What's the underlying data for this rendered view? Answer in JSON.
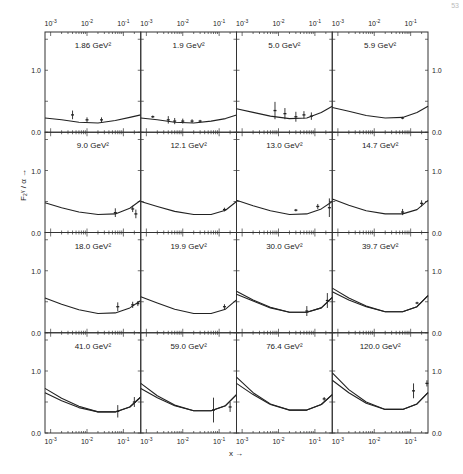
{
  "figure": {
    "page_number": "53",
    "ylabel": "F₂ᵞ / α →",
    "xlabel": "x →"
  },
  "chart_data": {
    "type": "line",
    "title": "",
    "xlabel": "x →",
    "ylabel": "F2^γ / α →",
    "xscale": "log",
    "xlim": [
      0.0007,
      0.3
    ],
    "ylim": [
      0.0,
      1.6
    ],
    "grid": false,
    "layout": "4x4 small multiples",
    "x_tick_labels": [
      "10^-3",
      "10^-2",
      "10^-1"
    ],
    "y_tick_labels": [
      "0.0",
      "1.0"
    ],
    "panels": [
      {
        "label": "1.86 GeV²",
        "q2": 1.86,
        "curves": [
          {
            "x": [
              0.0007,
              0.002,
              0.006,
              0.02,
              0.06,
              0.15,
              0.3
            ],
            "y": [
              0.23,
              0.2,
              0.16,
              0.15,
              0.19,
              0.24,
              0.28
            ]
          }
        ],
        "points": [
          {
            "x": 0.004,
            "y": 0.28,
            "err": 0.07
          },
          {
            "x": 0.01,
            "y": 0.2,
            "err": 0.04
          },
          {
            "x": 0.025,
            "y": 0.2,
            "err": 0.04
          }
        ]
      },
      {
        "label": "1.9 GeV²",
        "q2": 1.9,
        "curves": [
          {
            "x": [
              0.0007,
              0.002,
              0.006,
              0.02,
              0.06,
              0.15,
              0.3
            ],
            "y": [
              0.23,
              0.2,
              0.16,
              0.15,
              0.18,
              0.22,
              0.28
            ]
          }
        ],
        "points": [
          {
            "x": 0.0015,
            "y": 0.25,
            "err": 0.02
          },
          {
            "x": 0.004,
            "y": 0.2,
            "err": 0.06
          },
          {
            "x": 0.006,
            "y": 0.18,
            "err": 0.05
          },
          {
            "x": 0.01,
            "y": 0.18,
            "err": 0.04
          },
          {
            "x": 0.018,
            "y": 0.18,
            "err": 0.03
          },
          {
            "x": 0.03,
            "y": 0.18,
            "err": 0.02
          }
        ]
      },
      {
        "label": "5.0 GeV²",
        "q2": 5.0,
        "curves": [
          {
            "x": [
              0.0007,
              0.002,
              0.006,
              0.02,
              0.06,
              0.15,
              0.3
            ],
            "y": [
              0.38,
              0.32,
              0.26,
              0.22,
              0.23,
              0.32,
              0.42
            ]
          }
        ],
        "points": [
          {
            "x": 0.008,
            "y": 0.35,
            "err": 0.14
          },
          {
            "x": 0.015,
            "y": 0.3,
            "err": 0.09
          },
          {
            "x": 0.03,
            "y": 0.25,
            "err": 0.08
          },
          {
            "x": 0.05,
            "y": 0.28,
            "err": 0.06
          },
          {
            "x": 0.08,
            "y": 0.26,
            "err": 0.06
          }
        ]
      },
      {
        "label": "5.9 GeV²",
        "q2": 5.9,
        "curves": [
          {
            "x": [
              0.0007,
              0.002,
              0.006,
              0.02,
              0.06,
              0.15,
              0.3
            ],
            "y": [
              0.4,
              0.34,
              0.27,
              0.23,
              0.24,
              0.32,
              0.42
            ]
          }
        ],
        "points": [
          {
            "x": 0.06,
            "y": 0.23,
            "err": 0.02
          }
        ]
      },
      {
        "label": "9.0 GeV²",
        "q2": 9.0,
        "curves": [
          {
            "x": [
              0.0007,
              0.002,
              0.006,
              0.02,
              0.06,
              0.15,
              0.3
            ],
            "y": [
              0.48,
              0.4,
              0.33,
              0.29,
              0.3,
              0.39,
              0.52
            ]
          }
        ],
        "points": [
          {
            "x": 0.06,
            "y": 0.32,
            "err": 0.07
          },
          {
            "x": 0.18,
            "y": 0.38,
            "err": 0.05
          },
          {
            "x": 0.22,
            "y": 0.3,
            "err": 0.07
          }
        ]
      },
      {
        "label": "12.1 GeV²",
        "q2": 12.1,
        "curves": [
          {
            "x": [
              0.0007,
              0.002,
              0.006,
              0.02,
              0.06,
              0.15,
              0.3
            ],
            "y": [
              0.5,
              0.42,
              0.34,
              0.29,
              0.29,
              0.36,
              0.5
            ]
          }
        ],
        "points": [
          {
            "x": 0.14,
            "y": 0.37,
            "err": 0.03
          }
        ]
      },
      {
        "label": "13.0 GeV²",
        "q2": 13.0,
        "curves": [
          {
            "x": [
              0.0007,
              0.002,
              0.006,
              0.02,
              0.06,
              0.15,
              0.3
            ],
            "y": [
              0.52,
              0.43,
              0.35,
              0.29,
              0.3,
              0.38,
              0.5
            ]
          }
        ],
        "points": [
          {
            "x": 0.03,
            "y": 0.36,
            "err": 0.02
          },
          {
            "x": 0.12,
            "y": 0.42,
            "err": 0.04
          },
          {
            "x": 0.25,
            "y": 0.4,
            "err": 0.15
          }
        ]
      },
      {
        "label": "14.7 GeV²",
        "q2": 14.7,
        "curves": [
          {
            "x": [
              0.0007,
              0.002,
              0.006,
              0.02,
              0.06,
              0.15,
              0.3
            ],
            "y": [
              0.54,
              0.44,
              0.35,
              0.3,
              0.3,
              0.37,
              0.52
            ]
          }
        ],
        "points": [
          {
            "x": 0.06,
            "y": 0.33,
            "err": 0.05
          },
          {
            "x": 0.2,
            "y": 0.47,
            "err": 0.05
          }
        ]
      },
      {
        "label": "18.0 GeV²",
        "q2": 18.0,
        "curves": [
          {
            "x": [
              0.0007,
              0.002,
              0.006,
              0.02,
              0.06,
              0.15,
              0.3
            ],
            "y": [
              0.56,
              0.46,
              0.37,
              0.31,
              0.32,
              0.4,
              0.52
            ]
          }
        ],
        "points": [
          {
            "x": 0.07,
            "y": 0.42,
            "err": 0.07
          },
          {
            "x": 0.18,
            "y": 0.45,
            "err": 0.05
          },
          {
            "x": 0.25,
            "y": 0.47,
            "err": 0.04
          }
        ]
      },
      {
        "label": "19.9 GeV²",
        "q2": 19.9,
        "curves": [
          {
            "x": [
              0.0007,
              0.002,
              0.006,
              0.02,
              0.06,
              0.15,
              0.3
            ],
            "y": [
              0.58,
              0.48,
              0.38,
              0.31,
              0.31,
              0.38,
              0.53
            ]
          }
        ],
        "points": [
          {
            "x": 0.14,
            "y": 0.42,
            "err": 0.04
          }
        ]
      },
      {
        "label": "30.0 GeV²",
        "q2": 30.0,
        "curves": [
          {
            "x": [
              0.0007,
              0.002,
              0.006,
              0.02,
              0.06,
              0.15,
              0.3
            ],
            "y": [
              0.67,
              0.53,
              0.41,
              0.33,
              0.33,
              0.4,
              0.57
            ]
          },
          {
            "x": [
              0.0007,
              0.002,
              0.006,
              0.02,
              0.06,
              0.15,
              0.3
            ],
            "y": [
              0.62,
              0.51,
              0.4,
              0.33,
              0.33,
              0.4,
              0.57
            ]
          }
        ],
        "points": [
          {
            "x": 0.06,
            "y": 0.35,
            "err": 0.08
          },
          {
            "x": 0.22,
            "y": 0.52,
            "err": 0.12
          }
        ]
      },
      {
        "label": "39.7 GeV²",
        "q2": 39.7,
        "curves": [
          {
            "x": [
              0.0007,
              0.002,
              0.006,
              0.02,
              0.06,
              0.15,
              0.3
            ],
            "y": [
              0.72,
              0.56,
              0.43,
              0.34,
              0.34,
              0.42,
              0.6
            ]
          },
          {
            "x": [
              0.0007,
              0.002,
              0.006,
              0.02,
              0.06,
              0.15,
              0.3
            ],
            "y": [
              0.66,
              0.53,
              0.42,
              0.34,
              0.34,
              0.42,
              0.6
            ]
          }
        ],
        "points": [
          {
            "x": 0.15,
            "y": 0.48,
            "err": 0.02
          }
        ]
      },
      {
        "label": "41.0 GeV²",
        "q2": 41.0,
        "curves": [
          {
            "x": [
              0.0007,
              0.002,
              0.006,
              0.02,
              0.06,
              0.15,
              0.3
            ],
            "y": [
              0.72,
              0.56,
              0.43,
              0.34,
              0.34,
              0.42,
              0.58
            ]
          },
          {
            "x": [
              0.0007,
              0.002,
              0.006,
              0.02,
              0.06,
              0.15,
              0.3
            ],
            "y": [
              0.65,
              0.52,
              0.41,
              0.34,
              0.34,
              0.42,
              0.58
            ]
          }
        ],
        "points": [
          {
            "x": 0.07,
            "y": 0.35,
            "err": 0.1
          },
          {
            "x": 0.2,
            "y": 0.5,
            "err": 0.08
          }
        ]
      },
      {
        "label": "59.0 GeV²",
        "q2": 59.0,
        "curves": [
          {
            "x": [
              0.0007,
              0.002,
              0.006,
              0.02,
              0.06,
              0.15,
              0.3
            ],
            "y": [
              0.8,
              0.6,
              0.45,
              0.36,
              0.36,
              0.44,
              0.62
            ]
          },
          {
            "x": [
              0.0007,
              0.002,
              0.006,
              0.02,
              0.06,
              0.15,
              0.3
            ],
            "y": [
              0.72,
              0.57,
              0.44,
              0.36,
              0.36,
              0.44,
              0.62
            ]
          }
        ],
        "points": [
          {
            "x": 0.07,
            "y": 0.37,
            "err": 0.2
          },
          {
            "x": 0.2,
            "y": 0.42,
            "err": 0.08
          }
        ]
      },
      {
        "label": "76.4 GeV²",
        "q2": 76.4,
        "curves": [
          {
            "x": [
              0.0007,
              0.002,
              0.006,
              0.02,
              0.06,
              0.15,
              0.3
            ],
            "y": [
              0.9,
              0.65,
              0.47,
              0.37,
              0.37,
              0.46,
              0.62
            ]
          },
          {
            "x": [
              0.0007,
              0.002,
              0.006,
              0.02,
              0.06,
              0.15,
              0.3
            ],
            "y": [
              0.8,
              0.62,
              0.46,
              0.37,
              0.37,
              0.46,
              0.62
            ]
          }
        ],
        "points": [
          {
            "x": 0.18,
            "y": 0.55,
            "err": 0.03
          }
        ]
      },
      {
        "label": "120.0 GeV²",
        "q2": 120.0,
        "curves": [
          {
            "x": [
              0.0007,
              0.002,
              0.006,
              0.02,
              0.06,
              0.15,
              0.3
            ],
            "y": [
              0.97,
              0.7,
              0.5,
              0.38,
              0.38,
              0.47,
              0.65
            ]
          },
          {
            "x": [
              0.0007,
              0.002,
              0.006,
              0.02,
              0.06,
              0.15,
              0.3
            ],
            "y": [
              0.85,
              0.65,
              0.48,
              0.38,
              0.38,
              0.47,
              0.65
            ]
          }
        ],
        "points": [
          {
            "x": 0.12,
            "y": 0.68,
            "err": 0.12
          },
          {
            "x": 0.28,
            "y": 0.8,
            "err": 0.05
          }
        ]
      }
    ]
  }
}
